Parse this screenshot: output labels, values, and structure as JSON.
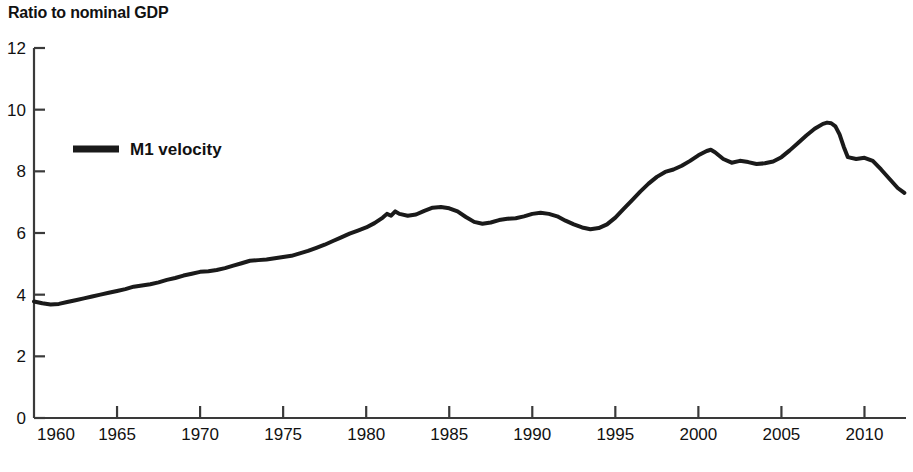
{
  "chart_data": {
    "type": "line",
    "title": "Ratio to nominal GDP",
    "xlabel": "",
    "ylabel": "",
    "ylim": [
      0,
      12
    ],
    "xlim": [
      1960,
      2012.5
    ],
    "grid": false,
    "legend_position": "inside-upper-left",
    "y_ticks": [
      "0",
      "2",
      "4",
      "6",
      "8",
      "10",
      "12"
    ],
    "y_tick_values": [
      0,
      2,
      4,
      6,
      8,
      10,
      12
    ],
    "x_ticks": [
      "1960",
      "1965",
      "1970",
      "1975",
      "1980",
      "1985",
      "1990",
      "1995",
      "2000",
      "2005",
      "2010"
    ],
    "x_tick_values": [
      1960,
      1965,
      1970,
      1975,
      1980,
      1985,
      1990,
      1995,
      2000,
      2005,
      2010
    ],
    "series": [
      {
        "name": "M1 velocity",
        "color": "#1a1a1a",
        "line_width": 4,
        "x": [
          1960.0,
          1960.5,
          1961.0,
          1961.5,
          1962.0,
          1962.5,
          1963.0,
          1963.5,
          1964.0,
          1964.5,
          1965.0,
          1965.5,
          1966.0,
          1966.5,
          1967.0,
          1967.5,
          1968.0,
          1968.5,
          1969.0,
          1969.5,
          1970.0,
          1970.5,
          1971.0,
          1971.5,
          1972.0,
          1972.5,
          1973.0,
          1973.5,
          1974.0,
          1974.5,
          1975.0,
          1975.5,
          1976.0,
          1976.5,
          1977.0,
          1977.5,
          1978.0,
          1978.5,
          1979.0,
          1979.5,
          1980.0,
          1980.5,
          1981.0,
          1981.25,
          1981.5,
          1981.75,
          1982.0,
          1982.5,
          1983.0,
          1983.5,
          1984.0,
          1984.5,
          1985.0,
          1985.5,
          1986.0,
          1986.5,
          1987.0,
          1987.5,
          1988.0,
          1988.5,
          1989.0,
          1989.5,
          1990.0,
          1990.5,
          1991.0,
          1991.5,
          1992.0,
          1992.5,
          1993.0,
          1993.5,
          1994.0,
          1994.5,
          1995.0,
          1995.5,
          1996.0,
          1996.5,
          1997.0,
          1997.5,
          1998.0,
          1998.5,
          1999.0,
          1999.5,
          2000.0,
          2000.5,
          2000.75,
          2001.0,
          2001.5,
          2002.0,
          2002.5,
          2003.0,
          2003.5,
          2004.0,
          2004.5,
          2005.0,
          2005.5,
          2006.0,
          2006.5,
          2007.0,
          2007.5,
          2007.75,
          2008.0,
          2008.25,
          2008.5,
          2008.75,
          2009.0,
          2009.5,
          2010.0,
          2010.5,
          2011.0,
          2011.5,
          2012.0,
          2012.4
        ],
        "y": [
          3.78,
          3.72,
          3.68,
          3.7,
          3.76,
          3.82,
          3.88,
          3.94,
          4.0,
          4.06,
          4.12,
          4.18,
          4.26,
          4.3,
          4.34,
          4.4,
          4.48,
          4.54,
          4.62,
          4.68,
          4.74,
          4.76,
          4.8,
          4.86,
          4.94,
          5.02,
          5.1,
          5.12,
          5.14,
          5.18,
          5.22,
          5.26,
          5.34,
          5.42,
          5.52,
          5.62,
          5.74,
          5.86,
          5.98,
          6.08,
          6.18,
          6.32,
          6.5,
          6.62,
          6.56,
          6.7,
          6.62,
          6.56,
          6.6,
          6.72,
          6.82,
          6.84,
          6.8,
          6.7,
          6.52,
          6.36,
          6.3,
          6.34,
          6.42,
          6.46,
          6.48,
          6.54,
          6.62,
          6.66,
          6.62,
          6.54,
          6.4,
          6.28,
          6.18,
          6.12,
          6.16,
          6.28,
          6.5,
          6.78,
          7.06,
          7.34,
          7.6,
          7.82,
          7.98,
          8.06,
          8.18,
          8.34,
          8.52,
          8.66,
          8.7,
          8.62,
          8.4,
          8.28,
          8.34,
          8.3,
          8.24,
          8.26,
          8.32,
          8.46,
          8.68,
          8.92,
          9.16,
          9.38,
          9.54,
          9.58,
          9.56,
          9.46,
          9.2,
          8.8,
          8.46,
          8.4,
          8.44,
          8.34,
          8.06,
          7.76,
          7.46,
          7.3
        ]
      }
    ]
  },
  "legend": {
    "entries": [
      {
        "label": "M1 velocity",
        "swatch": "line-swatch"
      }
    ]
  },
  "footer": {
    "artifact_text": " "
  }
}
